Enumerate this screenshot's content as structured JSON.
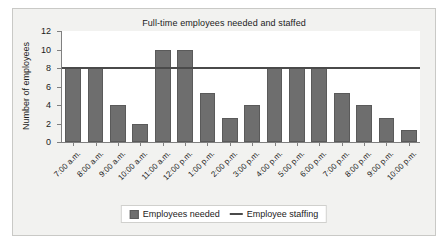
{
  "chart_data": {
    "type": "bar",
    "title": "Full-time employees needed and staffed",
    "xlabel": "",
    "ylabel": "Number of employees",
    "ylim": [
      0,
      12
    ],
    "yticks": [
      0,
      2,
      4,
      6,
      8,
      10,
      12
    ],
    "grid": false,
    "legend_position": "bottom",
    "categories": [
      "7:00 a.m.",
      "8:00 a.m.",
      "9:00 a.m.",
      "10:00 a.m.",
      "11:00 a.m.",
      "12:00 p.m.",
      "1:00 p.m.",
      "2:00 p.m.",
      "3:00 p.m.",
      "4:00 p.m.",
      "5:00 p.m.",
      "6:00 p.m.",
      "7:00 p.m.",
      "8:00 p.m.",
      "9:00 p.m.",
      "10:00 p.m."
    ],
    "series": [
      {
        "name": "Employees needed",
        "type": "bar",
        "color": "#6e6e6e",
        "values": [
          8,
          8,
          4,
          2,
          10,
          10,
          5.3,
          2.6,
          4,
          8,
          8,
          8,
          5.3,
          4,
          2.6,
          1.3
        ]
      },
      {
        "name": "Employee staffing",
        "type": "line",
        "color": "#4a4a4a",
        "constant_value": 8,
        "values": [
          8,
          8,
          8,
          8,
          8,
          8,
          8,
          8,
          8,
          8,
          8,
          8,
          8,
          8,
          8,
          8
        ]
      }
    ]
  },
  "legend": {
    "entries": [
      {
        "label": "Employees needed",
        "marker": "bar-swatch-icon"
      },
      {
        "label": "Employee staffing",
        "marker": "line-swatch-icon"
      }
    ]
  }
}
